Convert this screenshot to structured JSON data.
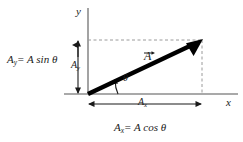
{
  "figure": {
    "kind": "vector-component-diagram",
    "background_color": "#ffffff",
    "axis_color": "#8c8c8c",
    "vector_color": "#000000",
    "dashed_color": "#9a9a9a",
    "text_color": "#1a1a1a"
  },
  "axes": {
    "y_label": "y",
    "x_label": "x",
    "origin": {
      "x": 88,
      "y": 94
    }
  },
  "vector": {
    "label": "A",
    "label_has_overarrow": true,
    "tail": {
      "x": 88,
      "y": 94
    },
    "tip": {
      "x": 202,
      "y": 40
    }
  },
  "angle": {
    "symbol": "θ"
  },
  "components": {
    "y": {
      "short_label_base": "A",
      "short_label_sub": "y",
      "equation_base": "A",
      "equation_sub": "y",
      "equation_rhs": "= A sin θ",
      "arrow_from": {
        "x": 78,
        "y": 40
      },
      "arrow_to": {
        "x": 78,
        "y": 94
      }
    },
    "x": {
      "short_label_base": "A",
      "short_label_sub": "x",
      "equation_base": "A",
      "equation_sub": "x",
      "equation_rhs": "= A cos θ",
      "arrow_from": {
        "x": 88,
        "y": 104
      },
      "arrow_to": {
        "x": 202,
        "y": 104
      }
    }
  },
  "guides": {
    "horizontal_dashed": {
      "x1": 88,
      "y1": 40,
      "x2": 202,
      "y2": 40
    },
    "vertical_dashed": {
      "x1": 202,
      "y1": 40,
      "x2": 202,
      "y2": 94
    }
  }
}
